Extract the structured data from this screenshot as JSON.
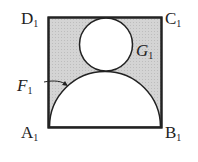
{
  "diagram": {
    "labels": {
      "D": "D",
      "D_sub": "1",
      "C": "C",
      "C_sub": "1",
      "A": "A",
      "A_sub": "1",
      "B": "B",
      "B_sub": "1",
      "G": "G",
      "G_sub": "1",
      "F": "F",
      "F_sub": "1"
    },
    "colors": {
      "shade": "#cfcfcf",
      "stroke": "#222222",
      "fill_white": "#ffffff"
    }
  }
}
